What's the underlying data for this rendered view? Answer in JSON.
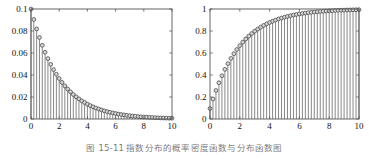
{
  "figure": {
    "caption_number": "图 15-11",
    "caption_text": "指数分布的概率密度函数与分布函数图",
    "background_color": "#ffffff",
    "line_color": "#555555",
    "marker_face_color": "#d8d8d8",
    "marker_edge_color": "#4a4a4a"
  },
  "chart_data": [
    {
      "type": "bar",
      "id": "exponential-pdf",
      "title": "",
      "subtitle": "",
      "xlabel": "",
      "ylabel": "",
      "xlim": [
        0,
        10
      ],
      "ylim": [
        0,
        0.1
      ],
      "xticks": [
        0,
        2,
        4,
        6,
        8,
        10
      ],
      "yticks": [
        0,
        0.02,
        0.04,
        0.06,
        0.08,
        0.1
      ],
      "xticklabels": [
        "0",
        "2",
        "4",
        "6",
        "8",
        "10"
      ],
      "yticklabels": [
        "0",
        "0.02",
        "0.04",
        "0.06",
        "0.08",
        "0.1"
      ],
      "grid": false,
      "legend": null,
      "legend_position": "none",
      "style": "stem",
      "marker": "circle",
      "annotations": [],
      "lambda": 0.1,
      "formula": "f(x) = 0.1 * exp(-0.1 * x)",
      "x": [
        0,
        0.2,
        0.4,
        0.6,
        0.8,
        1,
        1.2,
        1.4,
        1.6,
        1.8,
        2,
        2.2,
        2.4,
        2.6,
        2.8,
        3,
        3.2,
        3.4,
        3.6,
        3.8,
        4,
        4.2,
        4.4,
        4.6,
        4.8,
        5,
        5.2,
        5.4,
        5.6,
        5.8,
        6,
        6.2,
        6.4,
        6.6,
        6.8,
        7,
        7.2,
        7.4,
        7.6,
        7.8,
        8,
        8.2,
        8.4,
        8.6,
        8.8,
        9,
        9.2,
        9.4,
        9.6,
        9.8,
        10
      ],
      "values": [
        0.1,
        0.0905,
        0.0819,
        0.0741,
        0.067,
        0.0607,
        0.0549,
        0.0497,
        0.0449,
        0.0407,
        0.0368,
        0.0333,
        0.0301,
        0.0273,
        0.0247,
        0.0223,
        0.0202,
        0.0183,
        0.0165,
        0.015,
        0.0135,
        0.0122,
        0.0111,
        0.01,
        0.0091,
        0.0082,
        0.0074,
        0.0067,
        0.0061,
        0.0055,
        0.005,
        0.0045,
        0.0041,
        0.0037,
        0.0033,
        0.003,
        0.0027,
        0.0025,
        0.0022,
        0.002,
        0.0018,
        0.0017,
        0.0015,
        0.0014,
        0.0012,
        0.0011,
        0.001,
        0.0009,
        0.0008,
        0.0007,
        0.0007
      ]
    },
    {
      "type": "bar",
      "id": "exponential-cdf",
      "title": "",
      "subtitle": "",
      "xlabel": "",
      "ylabel": "",
      "xlim": [
        0,
        10
      ],
      "ylim": [
        0,
        1
      ],
      "xticks": [
        0,
        2,
        4,
        6,
        8,
        10
      ],
      "yticks": [
        0,
        0.2,
        0.4,
        0.6,
        0.8,
        1
      ],
      "xticklabels": [
        "0",
        "2",
        "4",
        "6",
        "8",
        "10"
      ],
      "yticklabels": [
        "0",
        "0.2",
        "0.4",
        "0.6",
        "0.8",
        "1"
      ],
      "grid": false,
      "legend": null,
      "legend_position": "none",
      "style": "stem",
      "marker": "circle",
      "annotations": [],
      "lambda": 1.0,
      "formula": "F(x) = 1 - exp(-x)",
      "x": [
        0,
        0.2,
        0.4,
        0.6,
        0.8,
        1,
        1.2,
        1.4,
        1.6,
        1.8,
        2,
        2.2,
        2.4,
        2.6,
        2.8,
        3,
        3.2,
        3.4,
        3.6,
        3.8,
        4,
        4.2,
        4.4,
        4.6,
        4.8,
        5,
        5.2,
        5.4,
        5.6,
        5.8,
        6,
        6.2,
        6.4,
        6.6,
        6.8,
        7,
        7.2,
        7.4,
        7.6,
        7.8,
        8,
        8.2,
        8.4,
        8.6,
        8.8,
        9,
        9.2,
        9.4,
        9.6,
        9.8,
        10
      ],
      "values": [
        0.0952,
        0.1813,
        0.2592,
        0.3297,
        0.3935,
        0.4512,
        0.5034,
        0.5507,
        0.5934,
        0.6321,
        0.6671,
        0.6988,
        0.7275,
        0.7534,
        0.7769,
        0.7981,
        0.8173,
        0.8347,
        0.8504,
        0.8647,
        0.8775,
        0.8892,
        0.8997,
        0.9093,
        0.9179,
        0.9257,
        0.9328,
        0.9392,
        0.945,
        0.9502,
        0.955,
        0.9593,
        0.9632,
        0.9667,
        0.9699,
        0.9727,
        0.9753,
        0.9777,
        0.9798,
        0.9817,
        0.9834,
        0.985,
        0.9864,
        0.9877,
        0.9889,
        0.9899,
        0.9909,
        0.9918,
        0.9925,
        0.9933,
        0.9939
      ]
    }
  ]
}
